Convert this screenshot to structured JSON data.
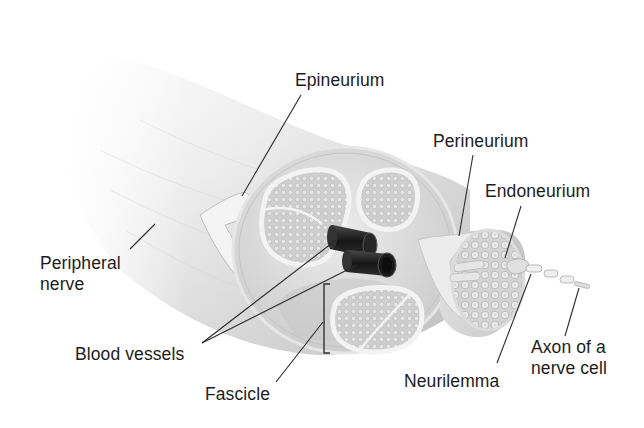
{
  "diagram": {
    "colors": {
      "background": "#ffffff",
      "label_text": "#1c1c1c",
      "leader_line": "#2a2a2a",
      "nerve_sheath": "#d9d9d9",
      "fascicle_fill": "#c9c9c9",
      "fascicle_rim": "#f2f2f2",
      "blood_vessel": "#1a1a1a"
    },
    "labels": {
      "epineurium": "Epineurium",
      "perineurium": "Perineurium",
      "endoneurium": "Endoneurium",
      "peripheral_nerve": [
        "Peripheral",
        "nerve"
      ],
      "blood_vessels": "Blood vessels",
      "fascicle": "Fascicle",
      "neurilemma": "Neurilemma",
      "axon": [
        "Axon of a",
        "nerve cell"
      ]
    }
  }
}
